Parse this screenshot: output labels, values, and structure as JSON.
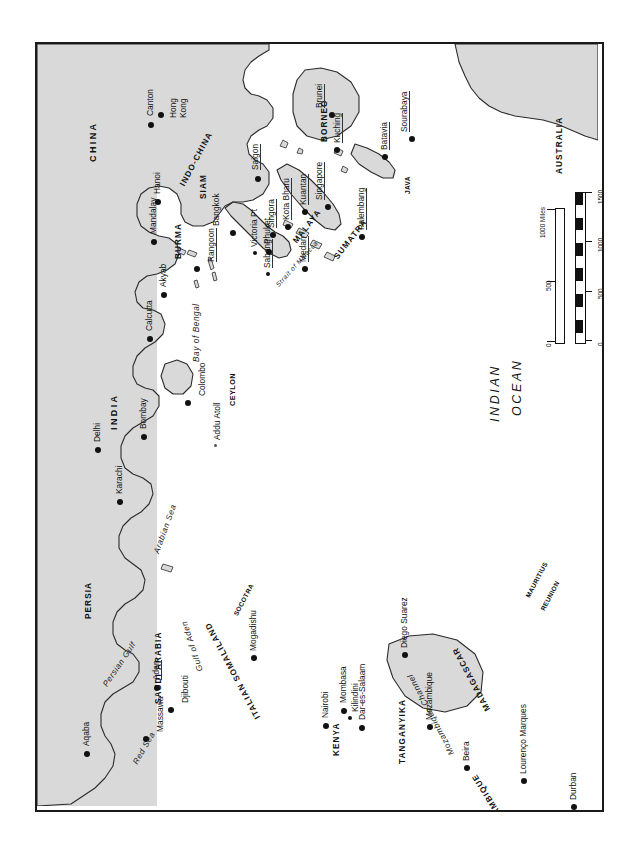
{
  "map": {
    "title": "Indian Ocean and South-East Asia",
    "orientation": "rotated-90-ccw",
    "colors": {
      "land": "#d9d9d9",
      "water": "#ffffff",
      "outline": "#2b2b2b",
      "frame": "#1a1a1a",
      "text": "#111111"
    },
    "ocean_labels": [
      {
        "name": "indian-ocean",
        "line1": "INDIAN",
        "line2": "OCEAN"
      }
    ],
    "seas": [
      {
        "name": "arabian-sea",
        "label": "Arabian Sea"
      },
      {
        "name": "bay-of-bengal",
        "label": "Bay of Bengal"
      },
      {
        "name": "red-sea",
        "label": "Red Sea"
      },
      {
        "name": "persian-gulf",
        "label": "Persian Gulf"
      },
      {
        "name": "gulf-of-aden",
        "label": "Gulf of Aden"
      },
      {
        "name": "strait-of-malacca",
        "label": "Strait of Malacca"
      },
      {
        "name": "mozambique-channel",
        "label": "Mozambique Channel"
      }
    ],
    "countries": [
      {
        "name": "china",
        "label": "CHINA"
      },
      {
        "name": "indo-china",
        "label": "INDO-CHINA"
      },
      {
        "name": "siam",
        "label": "SIAM"
      },
      {
        "name": "burma",
        "label": "BURMA"
      },
      {
        "name": "india",
        "label": "INDIA"
      },
      {
        "name": "ceylon",
        "label": "CEYLON"
      },
      {
        "name": "malaya",
        "label": "MALAYA"
      },
      {
        "name": "sumatra",
        "label": "SUMATRA"
      },
      {
        "name": "borneo",
        "label": "BORNEO"
      },
      {
        "name": "java",
        "label": "JAVA"
      },
      {
        "name": "australia",
        "label": "AUSTRALIA"
      },
      {
        "name": "persia",
        "label": "PERSIA"
      },
      {
        "name": "saudi-arabia",
        "label": "SAUDI ARABIA"
      },
      {
        "name": "italian-somaliland",
        "label": "ITALIAN SOMALILAND"
      },
      {
        "name": "kenya",
        "label": "KENYA"
      },
      {
        "name": "tanganyika",
        "label": "TANGANYIKA"
      },
      {
        "name": "mozambique",
        "label": "MOZAMBIQUE"
      },
      {
        "name": "madagascar",
        "label": "MADAGASCAR"
      },
      {
        "name": "socotra",
        "label": "SOCOTRA"
      },
      {
        "name": "mauritius",
        "label": "MAURITIUS"
      },
      {
        "name": "reunion",
        "label": "REUNION"
      }
    ],
    "cities": [
      {
        "name": "canton",
        "label": "Canton"
      },
      {
        "name": "hong-kong",
        "label": "Hong Kong"
      },
      {
        "name": "hanoi",
        "label": "Hanoi"
      },
      {
        "name": "mandalay",
        "label": "Mandalay"
      },
      {
        "name": "bangkok",
        "label": "Bangkok"
      },
      {
        "name": "saigon",
        "label": "Saigon"
      },
      {
        "name": "singora",
        "label": "Singora"
      },
      {
        "name": "kota-bharu",
        "label": "Kota Bharu"
      },
      {
        "name": "kuantan",
        "label": "Kuantan"
      },
      {
        "name": "singapore",
        "label": "Singapore"
      },
      {
        "name": "brunei",
        "label": "Brunei"
      },
      {
        "name": "kuching",
        "label": "Kuching"
      },
      {
        "name": "batavia",
        "label": "Batavia"
      },
      {
        "name": "sourabaya",
        "label": "Sourabaya"
      },
      {
        "name": "palembang",
        "label": "Palembang"
      },
      {
        "name": "medan",
        "label": "Medan"
      },
      {
        "name": "sabang",
        "label": "Sabang"
      },
      {
        "name": "phuket",
        "label": "Phuket"
      },
      {
        "name": "victoria-pt",
        "label": "Victoria Pt"
      },
      {
        "name": "rangoon",
        "label": "Rangoon"
      },
      {
        "name": "akyab",
        "label": "Akyab"
      },
      {
        "name": "calcutta",
        "label": "Calcutta"
      },
      {
        "name": "delhi",
        "label": "Delhi"
      },
      {
        "name": "karachi",
        "label": "Karachi"
      },
      {
        "name": "bombay",
        "label": "Bombay"
      },
      {
        "name": "colombo",
        "label": "Colombo"
      },
      {
        "name": "addu-atoll",
        "label": "Addu Atoll"
      },
      {
        "name": "aqaba",
        "label": "Aqaba"
      },
      {
        "name": "massawa",
        "label": "Massawa"
      },
      {
        "name": "aden",
        "label": "Aden"
      },
      {
        "name": "djibouti",
        "label": "Djibouti"
      },
      {
        "name": "mogadishu",
        "label": "Mogadishu"
      },
      {
        "name": "nairobi",
        "label": "Nairobi"
      },
      {
        "name": "mombasa",
        "label": "Mombasa"
      },
      {
        "name": "kilindini",
        "label": "Kilindini"
      },
      {
        "name": "dar-es-salaam",
        "label": "Dar-es-Salaam"
      },
      {
        "name": "mozambique-city",
        "label": "Mozambique"
      },
      {
        "name": "beira",
        "label": "Beira"
      },
      {
        "name": "lourenco-marques",
        "label": "Lourenço Marques"
      },
      {
        "name": "durban",
        "label": "Durban"
      },
      {
        "name": "diego-suarez",
        "label": "Diego Suarez"
      }
    ],
    "scale": {
      "kms_unit": "Kms",
      "kms_ticks": [
        "0",
        "500",
        "1000",
        "1500"
      ],
      "miles_unit": "1000 Miles",
      "miles_ticks": [
        "0",
        "500",
        "1000"
      ]
    }
  }
}
